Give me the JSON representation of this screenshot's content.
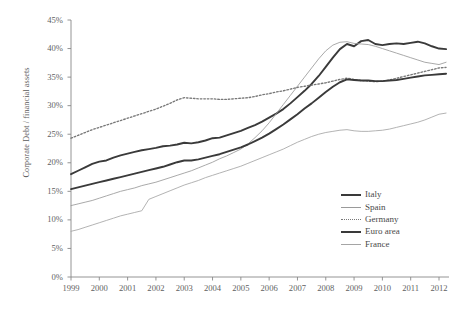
{
  "chart_data": {
    "type": "line",
    "title": "",
    "xlabel": "",
    "ylabel": "Corporate Debt / financial assets",
    "xlim": [
      1999,
      2012
    ],
    "ylim": [
      0,
      45
    ],
    "ytick_labels": [
      "45%",
      "40%",
      "35%",
      "30%",
      "25%",
      "20%",
      "15%",
      "10%",
      "5%",
      "0%"
    ],
    "ytick_values": [
      45,
      40,
      35,
      30,
      25,
      20,
      15,
      10,
      5,
      0
    ],
    "xtick_labels": [
      "1999",
      "2000",
      "2001",
      "2002",
      "2003",
      "2004",
      "2005",
      "2006",
      "2007",
      "2008",
      "2009",
      "2010",
      "2011",
      "2012"
    ],
    "xtick_values": [
      1999,
      2000,
      2001,
      2002,
      2003,
      2004,
      2005,
      2006,
      2007,
      2008,
      2009,
      2010,
      2011,
      2012
    ],
    "grid": false,
    "legend_position": "lower-right",
    "x": [
      1999,
      1999.25,
      1999.5,
      1999.75,
      2000,
      2000.25,
      2000.5,
      2000.75,
      2001,
      2001.25,
      2001.5,
      2001.75,
      2002,
      2002.25,
      2002.5,
      2002.75,
      2003,
      2003.25,
      2003.5,
      2003.75,
      2004,
      2004.25,
      2004.5,
      2004.75,
      2005,
      2005.25,
      2005.5,
      2005.75,
      2006,
      2006.25,
      2006.5,
      2006.75,
      2007,
      2007.25,
      2007.5,
      2007.75,
      2008,
      2008.25,
      2008.5,
      2008.75,
      2009,
      2009.25,
      2009.5,
      2009.75,
      2010,
      2010.25,
      2010.5,
      2010.75,
      2011,
      2011.25,
      2011.5,
      2011.75,
      2012,
      2012.25
    ],
    "series": [
      {
        "name": "Italy",
        "style": "solid-thick-dark",
        "color": "#3a3a3a",
        "values": [
          18.0,
          18.6,
          19.2,
          19.8,
          20.2,
          20.4,
          20.9,
          21.3,
          21.6,
          21.9,
          22.2,
          22.4,
          22.6,
          22.9,
          23.0,
          23.2,
          23.5,
          23.4,
          23.6,
          23.9,
          24.3,
          24.4,
          24.8,
          25.2,
          25.6,
          26.1,
          26.6,
          27.2,
          27.9,
          28.6,
          29.4,
          30.4,
          31.5,
          32.6,
          33.8,
          35.2,
          36.8,
          38.4,
          39.9,
          40.8,
          40.4,
          41.3,
          41.5,
          40.8,
          40.6,
          40.8,
          40.9,
          40.8,
          41.0,
          41.2,
          40.9,
          40.4,
          40.0,
          39.9
        ]
      },
      {
        "name": "Spain",
        "style": "solid-thin-gray",
        "color": "#9a9a9a",
        "values": [
          12.5,
          12.8,
          13.1,
          13.4,
          13.8,
          14.2,
          14.6,
          15.0,
          15.3,
          15.6,
          16.0,
          16.3,
          16.6,
          17.0,
          17.4,
          17.8,
          18.2,
          18.6,
          19.1,
          19.6,
          20.1,
          20.7,
          21.2,
          21.8,
          22.4,
          23.3,
          24.4,
          25.6,
          27.0,
          28.6,
          30.2,
          31.8,
          33.4,
          35.0,
          36.6,
          38.2,
          39.6,
          40.6,
          41.1,
          41.2,
          40.9,
          40.8,
          40.7,
          40.4,
          40.0,
          39.6,
          39.2,
          38.8,
          38.4,
          38.0,
          37.6,
          37.4,
          37.2,
          37.6
        ]
      },
      {
        "name": "Germany",
        "style": "dotted-gray",
        "color": "#787878",
        "values": [
          24.3,
          24.8,
          25.3,
          25.8,
          26.2,
          26.6,
          27.0,
          27.4,
          27.8,
          28.2,
          28.6,
          29.0,
          29.4,
          29.9,
          30.4,
          31.0,
          31.4,
          31.3,
          31.2,
          31.2,
          31.2,
          31.1,
          31.1,
          31.2,
          31.3,
          31.4,
          31.6,
          31.9,
          32.1,
          32.4,
          32.6,
          32.9,
          33.2,
          33.4,
          33.6,
          33.8,
          34.0,
          34.3,
          34.6,
          34.8,
          34.6,
          34.4,
          34.3,
          34.2,
          34.3,
          34.5,
          34.8,
          35.1,
          35.4,
          35.7,
          36.0,
          36.3,
          36.6,
          36.7
        ]
      },
      {
        "name": "Euro area",
        "style": "solid-thick-dark",
        "color": "#3a3a3a",
        "values": [
          15.4,
          15.7,
          16.0,
          16.3,
          16.6,
          16.9,
          17.2,
          17.5,
          17.8,
          18.1,
          18.4,
          18.7,
          19.0,
          19.3,
          19.7,
          20.1,
          20.4,
          20.4,
          20.6,
          20.9,
          21.2,
          21.5,
          21.9,
          22.3,
          22.7,
          23.2,
          23.8,
          24.4,
          25.1,
          25.9,
          26.7,
          27.6,
          28.5,
          29.5,
          30.4,
          31.4,
          32.4,
          33.3,
          34.1,
          34.6,
          34.5,
          34.4,
          34.4,
          34.3,
          34.3,
          34.4,
          34.5,
          34.7,
          34.9,
          35.1,
          35.3,
          35.4,
          35.5,
          35.6
        ]
      },
      {
        "name": "France",
        "style": "solid-thin-gray",
        "color": "#a5a5a5",
        "values": [
          8.0,
          8.3,
          8.7,
          9.1,
          9.5,
          9.9,
          10.3,
          10.7,
          11.0,
          11.3,
          11.6,
          13.6,
          14.1,
          14.6,
          15.1,
          15.6,
          16.1,
          16.5,
          16.9,
          17.4,
          17.8,
          18.2,
          18.6,
          19.0,
          19.4,
          19.9,
          20.4,
          20.9,
          21.4,
          21.9,
          22.4,
          23.0,
          23.6,
          24.1,
          24.6,
          25.0,
          25.3,
          25.5,
          25.7,
          25.8,
          25.6,
          25.5,
          25.5,
          25.6,
          25.7,
          25.9,
          26.2,
          26.5,
          26.8,
          27.1,
          27.5,
          28.0,
          28.5,
          28.7
        ]
      }
    ]
  },
  "legend": {
    "items": [
      {
        "label": "Italy"
      },
      {
        "label": "Spain"
      },
      {
        "label": "Germany"
      },
      {
        "label": "Euro area"
      },
      {
        "label": "France"
      }
    ]
  }
}
